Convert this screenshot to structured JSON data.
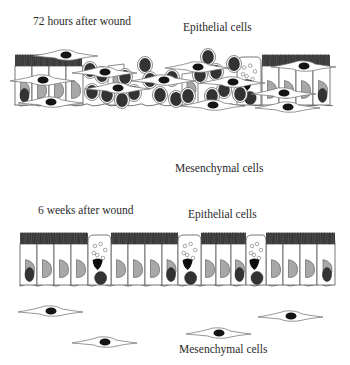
{
  "colors": {
    "outline": "#555555",
    "dark_nucleus": "#333333",
    "light_nucleus": "#a8a8a8",
    "black_nucleus": "#0d0d0d",
    "cilia": "#2e2e2e",
    "background": "#ffffff"
  },
  "panels": [
    {
      "id": "72h",
      "time_label": "72 hours after wound",
      "epithelium_label": "Epithelial cells",
      "mesenchyme_label": "Mesenchymal cells",
      "time_label_pos": [
        33,
        16
      ],
      "epithelium_label_pos": [
        183,
        22
      ],
      "mesenchyme_label_pos": [
        175,
        163
      ],
      "epithelium": {
        "top": 55,
        "bottom": 105,
        "left": 15,
        "right": 337
      },
      "ciliated_segments": [
        [
          15,
          82
        ],
        [
          262,
          330
        ]
      ],
      "columnar_cells": [
        {
          "x": 15,
          "w": 17,
          "nucleus": "dark_light"
        },
        {
          "x": 32,
          "w": 17,
          "nucleus": "light"
        },
        {
          "x": 49,
          "w": 17,
          "nucleus": "light"
        },
        {
          "x": 66,
          "w": 17,
          "nucleus": "light"
        },
        {
          "x": 262,
          "w": 17,
          "nucleus": "light"
        },
        {
          "x": 279,
          "w": 17,
          "nucleus": "light"
        },
        {
          "x": 296,
          "w": 17,
          "nucleus": "light"
        },
        {
          "x": 313,
          "w": 17,
          "nucleus": "dark_light"
        }
      ],
      "goblet_cells": [
        {
          "x": 237,
          "w": 24
        }
      ],
      "proliferating_nuclei": [
        [
          90,
          70
        ],
        [
          102,
          75
        ],
        [
          92,
          92
        ],
        [
          107,
          95
        ],
        [
          125,
          77
        ],
        [
          145,
          65
        ],
        [
          134,
          93
        ],
        [
          150,
          80
        ],
        [
          160,
          95
        ],
        [
          172,
          78
        ],
        [
          176,
          99
        ],
        [
          200,
          75
        ],
        [
          208,
          57
        ],
        [
          216,
          72
        ],
        [
          224,
          90
        ],
        [
          212,
          96
        ],
        [
          234,
          64
        ],
        [
          240,
          94
        ],
        [
          122,
          100
        ],
        [
          188,
          96
        ]
      ],
      "light_nuclei_in_proliferation": [
        [
          116,
          80
        ],
        [
          190,
          88
        ]
      ],
      "mesenchymal_cells": [
        [
          65,
          55
        ],
        [
          104,
          72
        ],
        [
          42,
          80
        ],
        [
          163,
          80
        ],
        [
          197,
          67
        ],
        [
          232,
          82
        ],
        [
          303,
          66
        ],
        [
          283,
          93
        ],
        [
          50,
          102
        ],
        [
          117,
          88
        ],
        [
          212,
          105
        ],
        [
          287,
          107
        ]
      ]
    },
    {
      "id": "6w",
      "time_label": "6 weeks after wound",
      "epithelium_label": "Epithelial cells",
      "mesenchyme_label": "Mesenchymal cells",
      "time_label_pos": [
        38,
        205
      ],
      "epithelium_label_pos": [
        188,
        209
      ],
      "mesenchyme_label_pos": [
        179,
        344
      ],
      "epithelium": {
        "top": 233,
        "bottom": 285,
        "left": 20,
        "right": 335
      },
      "ciliated_segments": [
        [
          20,
          88
        ],
        [
          111,
          178
        ],
        [
          201,
          246
        ],
        [
          266,
          335
        ]
      ],
      "columnar_cells": [
        {
          "x": 20,
          "w": 17,
          "nucleus": "dark_light"
        },
        {
          "x": 37,
          "w": 17,
          "nucleus": "light"
        },
        {
          "x": 54,
          "w": 17,
          "nucleus": "light"
        },
        {
          "x": 71,
          "w": 17,
          "nucleus": "light"
        },
        {
          "x": 111,
          "w": 17,
          "nucleus": "light"
        },
        {
          "x": 128,
          "w": 17,
          "nucleus": "light"
        },
        {
          "x": 145,
          "w": 17,
          "nucleus": "light"
        },
        {
          "x": 162,
          "w": 16,
          "nucleus": "dark_light"
        },
        {
          "x": 201,
          "w": 15,
          "nucleus": "light"
        },
        {
          "x": 216,
          "w": 15,
          "nucleus": "light"
        },
        {
          "x": 231,
          "w": 15,
          "nucleus": "dark_light"
        },
        {
          "x": 266,
          "w": 17,
          "nucleus": "light"
        },
        {
          "x": 283,
          "w": 17,
          "nucleus": "light"
        },
        {
          "x": 300,
          "w": 17,
          "nucleus": "light"
        },
        {
          "x": 317,
          "w": 18,
          "nucleus": "dark_light"
        }
      ],
      "goblet_cells": [
        {
          "x": 88,
          "w": 23
        },
        {
          "x": 178,
          "w": 23
        },
        {
          "x": 246,
          "w": 20
        }
      ],
      "proliferating_nuclei": [],
      "light_nuclei_in_proliferation": [],
      "mesenchymal_cells": [
        [
          50,
          311
        ],
        [
          290,
          316
        ],
        [
          218,
          333
        ],
        [
          104,
          342
        ]
      ]
    }
  ]
}
